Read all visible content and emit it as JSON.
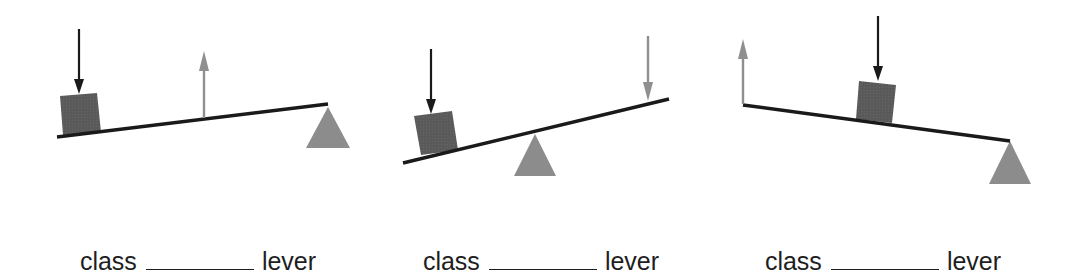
{
  "colors": {
    "beam": "#1a1a1a",
    "load_block": "#5a5a5a",
    "fulcrum": "#8c8c8c",
    "load_arrow": "#1a1a1a",
    "effort_arrow": "#8f8f8f",
    "text": "#1e1e1e"
  },
  "levers": [
    {
      "id": "lever-1",
      "label": {
        "prefix": "class",
        "blank": "",
        "suffix": "lever"
      },
      "arrangement": "load - effort - fulcrum",
      "effort_direction": "up"
    },
    {
      "id": "lever-2",
      "label": {
        "prefix": "class",
        "blank": "",
        "suffix": "lever"
      },
      "arrangement": "load - fulcrum - effort",
      "effort_direction": "down"
    },
    {
      "id": "lever-3",
      "label": {
        "prefix": "class",
        "blank": "",
        "suffix": "lever"
      },
      "arrangement": "effort - load - fulcrum",
      "effort_direction": "up"
    }
  ]
}
